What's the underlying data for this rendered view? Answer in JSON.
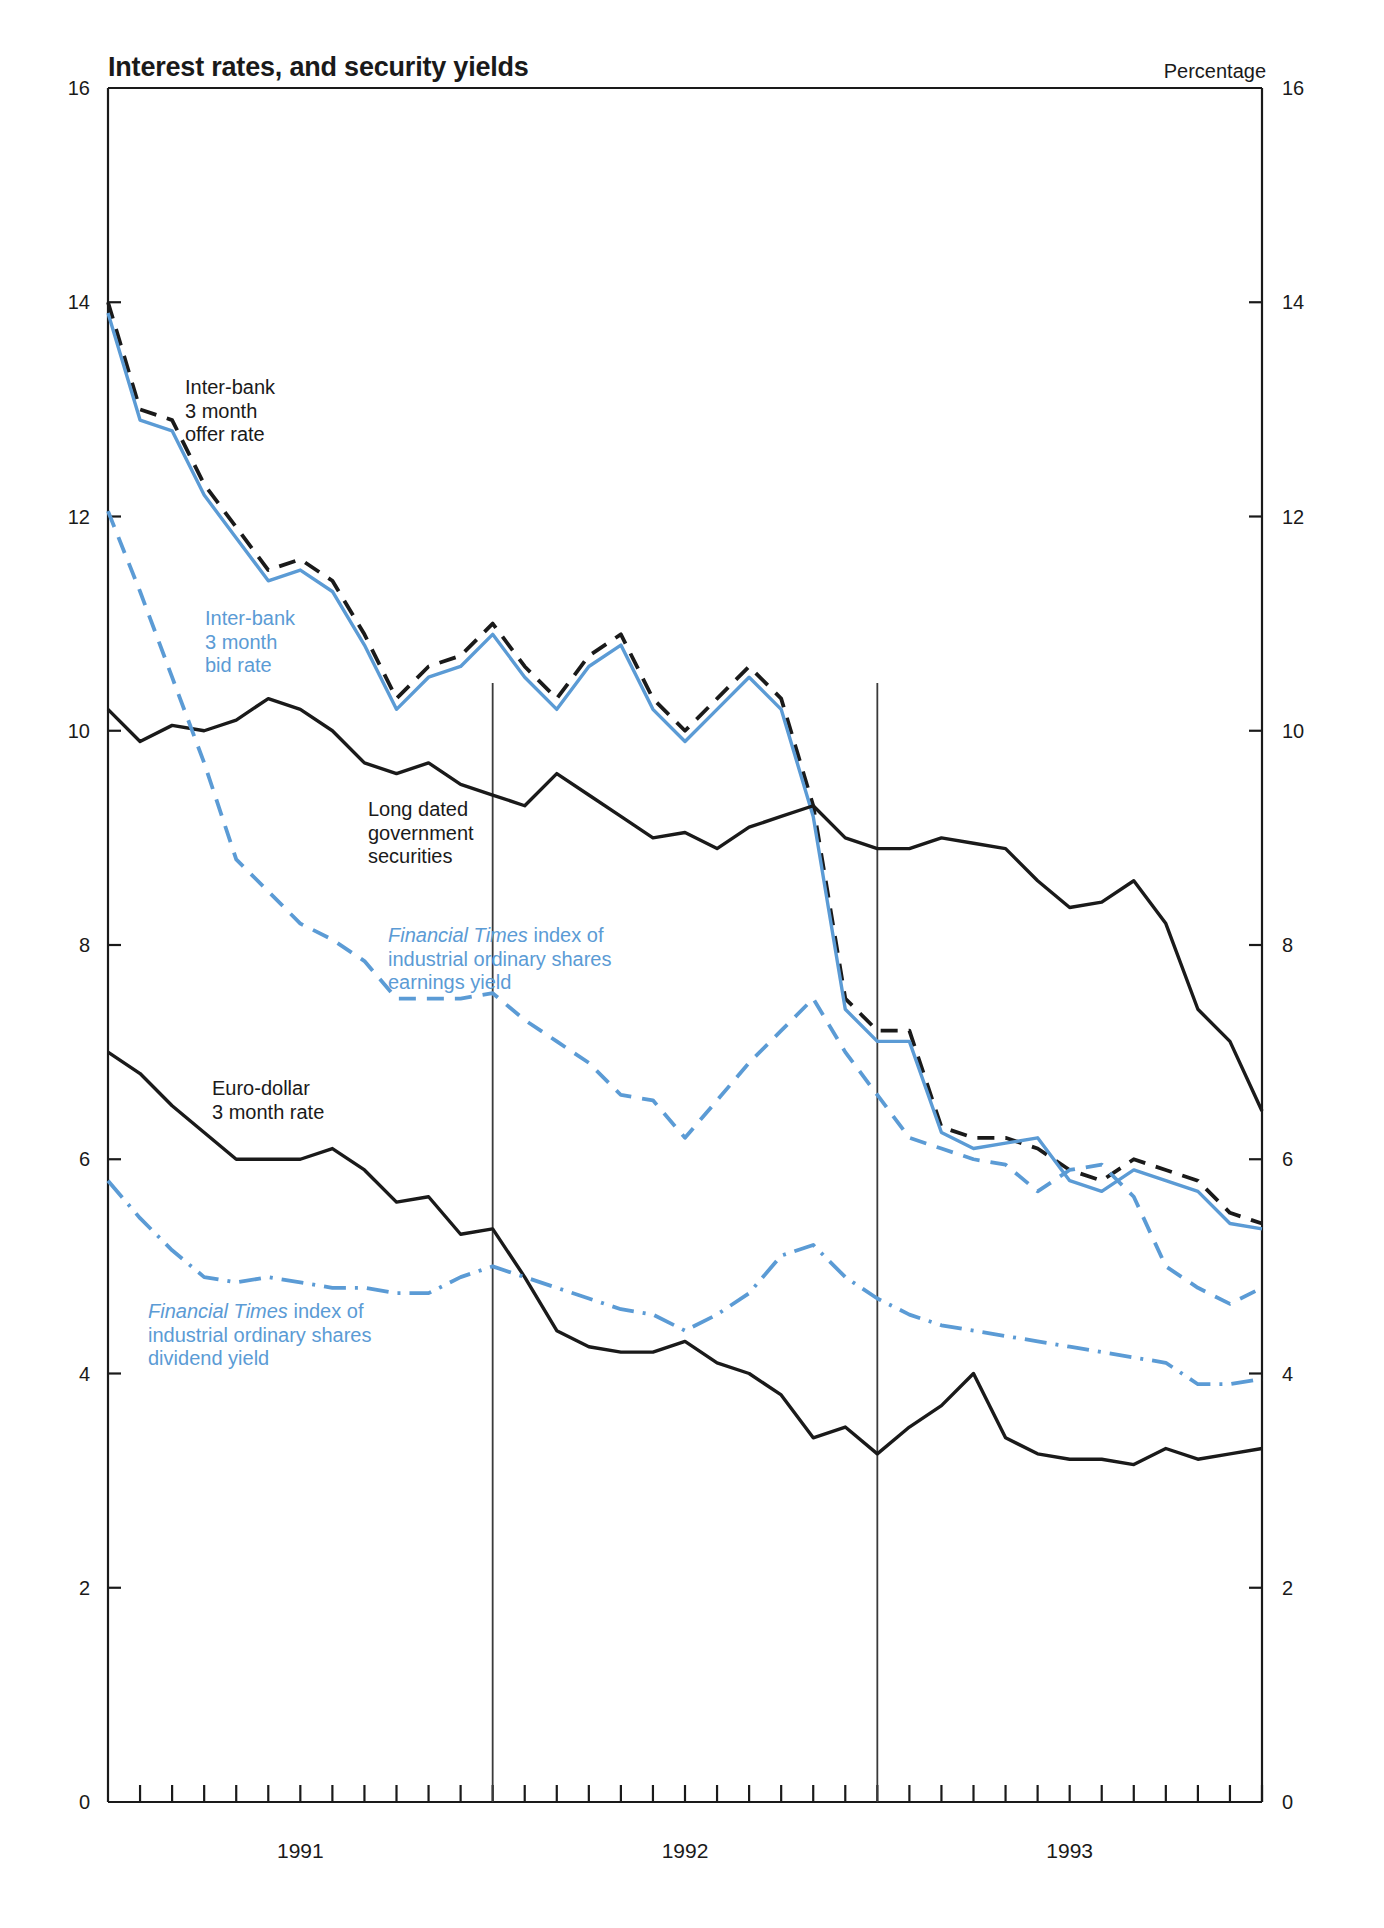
{
  "header": {
    "title": "Interest rates, and security yields",
    "unit_label": "Percentage"
  },
  "annotations": {
    "interbank_offer": "Inter-bank\n3 month\noffer rate",
    "interbank_bid": "Inter-bank\n3 month\nbid rate",
    "long_dated": "Long dated\ngovernment\nsecurities",
    "ft_earnings_em": "Financial Times",
    "ft_earnings_rest": " index of\nindustrial ordinary shares\nearnings yield",
    "eurodollar": "Euro-dollar\n3 month rate",
    "ft_dividend_em": "Financial Times",
    "ft_dividend_rest": " index of\nindustrial ordinary shares\ndividend yield"
  },
  "colors": {
    "blue": "#5B9BD5",
    "black": "#1a1a1a",
    "divider": "#3a3a3a"
  },
  "chart_data": {
    "type": "line",
    "title": "Interest rates, and security yields",
    "xlabel": "",
    "ylabel": "Percentage",
    "ylim": [
      0,
      16
    ],
    "yticks": [
      0,
      2,
      4,
      6,
      8,
      10,
      12,
      14,
      16
    ],
    "y_axis_both_sides": true,
    "grid": false,
    "legend": "inline-annotations",
    "xlim": [
      "1990-12",
      "1993-12"
    ],
    "xticks_minor": "monthly",
    "xtick_labels": [
      "1991",
      "1992",
      "1993"
    ],
    "xtick_label_positions": [
      "1991-06",
      "1992-06",
      "1993-06"
    ],
    "year_dividers": [
      "1991-12",
      "1992-12"
    ],
    "x": [
      "1990-12",
      "1991-01",
      "1991-02",
      "1991-03",
      "1991-04",
      "1991-05",
      "1991-06",
      "1991-07",
      "1991-08",
      "1991-09",
      "1991-10",
      "1991-11",
      "1991-12",
      "1992-01",
      "1992-02",
      "1992-03",
      "1992-04",
      "1992-05",
      "1992-06",
      "1992-07",
      "1992-08",
      "1992-09",
      "1992-10",
      "1992-11",
      "1992-12",
      "1993-01",
      "1993-02",
      "1993-03",
      "1993-04",
      "1993-05",
      "1993-06",
      "1993-07",
      "1993-08",
      "1993-09",
      "1993-10",
      "1993-11",
      "1993-12"
    ],
    "series": [
      {
        "name": "Inter-bank 3 month offer rate",
        "color": "#1a1a1a",
        "style": "dashed",
        "values": [
          14.0,
          13.0,
          12.9,
          12.3,
          11.9,
          11.5,
          11.6,
          11.4,
          10.9,
          10.3,
          10.6,
          10.7,
          11.0,
          10.6,
          10.3,
          10.7,
          10.9,
          10.3,
          10.0,
          10.3,
          10.6,
          10.3,
          9.3,
          7.5,
          7.2,
          7.2,
          6.3,
          6.2,
          6.2,
          6.1,
          5.9,
          5.8,
          6.0,
          5.9,
          5.8,
          5.5,
          5.4
        ]
      },
      {
        "name": "Inter-bank 3 month bid rate",
        "color": "#5B9BD5",
        "style": "solid",
        "values": [
          13.9,
          12.9,
          12.8,
          12.2,
          11.8,
          11.4,
          11.5,
          11.3,
          10.8,
          10.2,
          10.5,
          10.6,
          10.9,
          10.5,
          10.2,
          10.6,
          10.8,
          10.2,
          9.9,
          10.2,
          10.5,
          10.2,
          9.2,
          7.4,
          7.1,
          7.1,
          6.25,
          6.1,
          6.15,
          6.2,
          5.8,
          5.7,
          5.9,
          5.8,
          5.7,
          5.4,
          5.35
        ]
      },
      {
        "name": "Long dated government securities",
        "color": "#1a1a1a",
        "style": "solid",
        "values": [
          10.2,
          9.9,
          10.05,
          10.0,
          10.1,
          10.3,
          10.2,
          10.0,
          9.7,
          9.6,
          9.7,
          9.5,
          9.4,
          9.3,
          9.6,
          9.4,
          9.2,
          9.0,
          9.05,
          8.9,
          9.1,
          9.2,
          9.3,
          9.0,
          8.9,
          8.9,
          9.0,
          8.95,
          8.9,
          8.6,
          8.35,
          8.4,
          8.6,
          8.2,
          7.4,
          7.1,
          6.45
        ]
      },
      {
        "name": "Financial Times index of industrial ordinary shares earnings yield",
        "color": "#5B9BD5",
        "style": "dashed",
        "values": [
          12.05,
          11.3,
          10.5,
          9.7,
          8.8,
          8.5,
          8.2,
          8.05,
          7.85,
          7.5,
          7.5,
          7.5,
          7.55,
          7.3,
          7.1,
          6.9,
          6.6,
          6.55,
          6.2,
          6.55,
          6.9,
          7.2,
          7.5,
          7.0,
          6.6,
          6.2,
          6.1,
          6.0,
          5.95,
          5.7,
          5.9,
          5.95,
          5.65,
          5.0,
          4.8,
          4.65,
          4.8
        ]
      },
      {
        "name": "Euro-dollar 3 month rate",
        "color": "#1a1a1a",
        "style": "solid",
        "values": [
          7.0,
          6.8,
          6.5,
          6.25,
          6.0,
          6.0,
          6.0,
          6.1,
          5.9,
          5.6,
          5.65,
          5.3,
          5.35,
          4.9,
          4.4,
          4.25,
          4.2,
          4.2,
          4.3,
          4.1,
          4.0,
          3.8,
          3.4,
          3.5,
          3.25,
          3.5,
          3.7,
          4.0,
          3.4,
          3.25,
          3.2,
          3.2,
          3.15,
          3.3,
          3.2,
          3.25,
          3.3
        ]
      },
      {
        "name": "Financial Times index of industrial ordinary shares dividend yield",
        "color": "#5B9BD5",
        "style": "dashdot",
        "values": [
          5.8,
          5.45,
          5.15,
          4.9,
          4.85,
          4.9,
          4.85,
          4.8,
          4.8,
          4.75,
          4.75,
          4.9,
          5.0,
          4.9,
          4.8,
          4.7,
          4.6,
          4.55,
          4.4,
          4.55,
          4.75,
          5.1,
          5.2,
          4.9,
          4.7,
          4.55,
          4.45,
          4.4,
          4.35,
          4.3,
          4.25,
          4.2,
          4.15,
          4.1,
          3.9,
          3.9,
          3.95
        ]
      }
    ]
  }
}
